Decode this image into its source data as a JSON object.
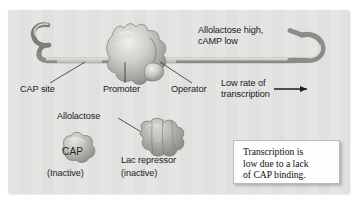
{
  "figure": {
    "background_color": "#ffffff",
    "panel_color": "#e3e3e2"
  },
  "labels": {
    "condition_line1": "Allolactose high,",
    "condition_line2": "cAMP low",
    "cap_site": "CAP site",
    "promoter": "Promoter",
    "operator": "Operator",
    "rate_line1": "Low rate of",
    "rate_line2": "transcription",
    "allolactose": "Allolactose",
    "cap_protein": "CAP",
    "cap_state": "(Inactive)",
    "lac_repressor": "Lac repressor",
    "lac_repressor_state": "(inactive)"
  },
  "callout": {
    "line1": "Transcription is",
    "line2": "low due to a lack",
    "line3": "of CAP binding."
  },
  "icons": {
    "transcription_arrow": "right-arrow-icon",
    "dna_strand": "dna-strand-icon",
    "rna_polymerase": "rna-polymerase-blob-icon",
    "cap_blob": "cap-protein-blob-icon",
    "repressor_blob": "lac-repressor-blob-icon"
  },
  "colors": {
    "dna_strand": "#8e8e8b",
    "dna_highlight": "#d8d8d4",
    "protein": "#a9a9a4",
    "text": "#1b1b1b",
    "callout_bg": "#fdfdfb"
  }
}
